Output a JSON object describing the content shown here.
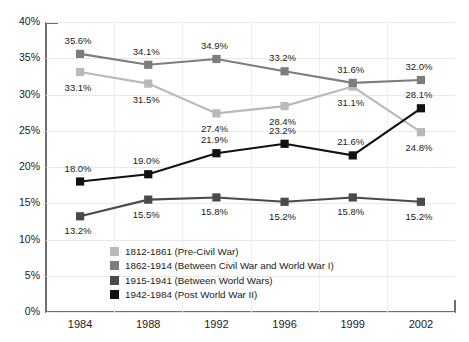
{
  "chart_data": {
    "type": "line",
    "title": "",
    "xlabel": "",
    "ylabel": "",
    "categories": [
      "1984",
      "1988",
      "1992",
      "1996",
      "1999",
      "2002"
    ],
    "ylim": [
      0,
      40
    ],
    "ytick_labels": [
      "0%",
      "5%",
      "10%",
      "15%",
      "20%",
      "25%",
      "30%",
      "35%",
      "40%"
    ],
    "ytick_values": [
      0,
      5,
      10,
      15,
      20,
      25,
      30,
      35,
      40
    ],
    "grid": true,
    "legend_position": "inside-lower-left",
    "series": [
      {
        "name": "1812-1861 (Pre-Civil War)",
        "color": "#b9b9b9",
        "values": [
          33.1,
          31.5,
          27.4,
          28.4,
          31.1,
          24.8
        ],
        "labels": [
          "33.1%",
          "31.5%",
          "27.4%",
          "28.4%",
          "31.1%",
          "24.8%"
        ]
      },
      {
        "name": "1862-1914 (Between Civil War and World War I)",
        "color": "#7d7d7d",
        "values": [
          35.6,
          34.1,
          34.9,
          33.2,
          31.6,
          32.0
        ],
        "labels": [
          "35.6%",
          "34.1%",
          "34.9%",
          "33.2%",
          "31.6%",
          "32.0%"
        ]
      },
      {
        "name": "1915-1941 (Between World Wars)",
        "color": "#4a4a4a",
        "values": [
          13.2,
          15.5,
          15.8,
          15.2,
          15.8,
          15.2
        ],
        "labels": [
          "13.2%",
          "15.5%",
          "15.8%",
          "15.2%",
          "15.8%",
          "15.2%"
        ]
      },
      {
        "name": "1942-1984 (Post World War II)",
        "color": "#111111",
        "values": [
          18.0,
          19.0,
          21.9,
          23.2,
          21.6,
          28.1
        ],
        "labels": [
          "18.0%",
          "19.0%",
          "21.9%",
          "23.2%",
          "21.6%",
          "28.1%"
        ]
      }
    ],
    "label_offsets": [
      [
        [
          -2,
          16
        ],
        [
          -2,
          16
        ],
        [
          -2,
          16
        ],
        [
          -2,
          16
        ],
        [
          -2,
          16
        ],
        [
          -2,
          16
        ]
      ],
      [
        [
          -2,
          -13
        ],
        [
          -2,
          -13
        ],
        [
          -2,
          -13
        ],
        [
          -2,
          -13
        ],
        [
          -2,
          -13
        ],
        [
          -2,
          -13
        ]
      ],
      [
        [
          -2,
          15
        ],
        [
          -2,
          15
        ],
        [
          -2,
          15
        ],
        [
          -2,
          15
        ],
        [
          -2,
          15
        ],
        [
          -2,
          15
        ]
      ],
      [
        [
          -2,
          -13
        ],
        [
          -2,
          -13
        ],
        [
          -2,
          -13
        ],
        [
          -2,
          -13
        ],
        [
          -2,
          -13
        ],
        [
          -2,
          -13
        ]
      ]
    ]
  }
}
